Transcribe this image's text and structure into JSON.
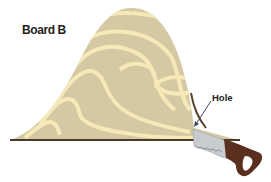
{
  "diagram": {
    "title": "Board B",
    "labels": {
      "hole": "Hole"
    },
    "colors": {
      "wood": "#d5c9a3",
      "grain": "#f6e9b8",
      "base_line": "#4a3c2c",
      "saw_blade": "#c8ccd0",
      "saw_handle": "#5a2f1d",
      "arrow": "#4a3c2c"
    },
    "elements": [
      "board-b",
      "saw",
      "hole-pointer"
    ]
  }
}
